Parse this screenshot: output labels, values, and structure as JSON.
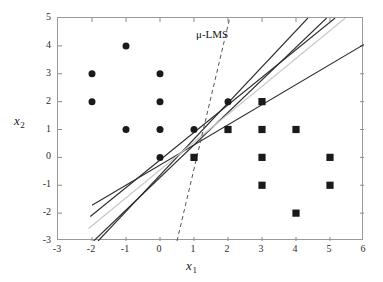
{
  "chart_data": {
    "type": "scatter",
    "title": "",
    "xlabel": "x1",
    "ylabel": "x2",
    "xlim": [
      -3,
      6
    ],
    "ylim": [
      -3,
      5
    ],
    "xticks": [
      -3,
      -2,
      -1,
      0,
      1,
      2,
      3,
      4,
      5,
      6
    ],
    "yticks": [
      -3,
      -2,
      -1,
      0,
      1,
      2,
      3,
      4,
      5
    ],
    "xtick_labels": [
      "-3",
      "-2",
      "-1",
      "0",
      "1",
      "2",
      "3",
      "4",
      "5",
      "6"
    ],
    "ytick_labels": [
      "-3",
      "-2",
      "-1",
      "0",
      "1",
      "2",
      "3",
      "4",
      "5"
    ],
    "grid": false,
    "legend": false,
    "series": [
      {
        "name": "class-1-circles",
        "marker": "circle",
        "color": "#1a1a1a",
        "points": [
          [
            -2,
            3
          ],
          [
            -2,
            2
          ],
          [
            -1,
            4
          ],
          [
            -1,
            1
          ],
          [
            0,
            3
          ],
          [
            0,
            2
          ],
          [
            0,
            1
          ],
          [
            0,
            0
          ],
          [
            1,
            1
          ],
          [
            2,
            2
          ]
        ]
      },
      {
        "name": "class-2-squares",
        "marker": "square",
        "color": "#1a1a1a",
        "points": [
          [
            1,
            0
          ],
          [
            2,
            1
          ],
          [
            3,
            2
          ],
          [
            3,
            1
          ],
          [
            3,
            0
          ],
          [
            3,
            -1
          ],
          [
            4,
            1
          ],
          [
            4,
            -2
          ],
          [
            5,
            0
          ],
          [
            5,
            -1
          ]
        ]
      }
    ],
    "lines": [
      {
        "name": "boundary-solid-1",
        "style": "solid",
        "color": "#2b2b2b",
        "width": 1.1,
        "from": [
          -2.0,
          -1.72
        ],
        "to": [
          6.0,
          4.05
        ]
      },
      {
        "name": "boundary-solid-2",
        "style": "solid",
        "color": "#2b2b2b",
        "width": 1.1,
        "from": [
          -2.05,
          -2.12
        ],
        "to": [
          5.15,
          5.0
        ]
      },
      {
        "name": "boundary-solid-3",
        "style": "solid",
        "color": "#2b2b2b",
        "width": 1.1,
        "from": [
          -1.95,
          -3.0
        ],
        "to": [
          4.9,
          5.0
        ]
      },
      {
        "name": "boundary-solid-4",
        "style": "solid",
        "color": "#2b2b2b",
        "width": 1.1,
        "from": [
          -1.82,
          -3.0
        ],
        "to": [
          4.35,
          5.0
        ]
      },
      {
        "name": "boundary-gray",
        "style": "solid",
        "color": "#c9c9c9",
        "width": 1.2,
        "from": [
          -2.1,
          -2.55
        ],
        "to": [
          5.45,
          5.0
        ]
      },
      {
        "name": "boundary-mu-lms-dashed",
        "style": "dashed",
        "color": "#555555",
        "width": 1.0,
        "from": [
          0.5,
          -3.0
        ],
        "to": [
          2.05,
          5.0
        ]
      }
    ],
    "annotations": [
      {
        "name": "mu-lms-label",
        "text": "μ-LMS",
        "x": 1.1,
        "y": 4.55
      }
    ],
    "convergence_point": [
      1.33,
      0.92
    ]
  },
  "axes": {
    "x_title": "x",
    "x_title_sub": "1",
    "y_title": "x",
    "y_title_sub": "2"
  }
}
